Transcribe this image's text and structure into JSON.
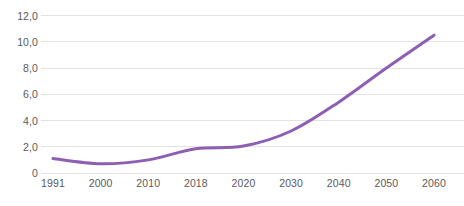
{
  "chart_data": {
    "type": "line",
    "title": "",
    "subtitle": "",
    "xlabel": "",
    "ylabel": "",
    "categories": [
      "1991",
      "2000",
      "2010",
      "2018",
      "2020",
      "2030",
      "2040",
      "2050",
      "2060"
    ],
    "values": [
      1.1,
      0.7,
      1.0,
      1.85,
      2.05,
      3.2,
      5.4,
      8.0,
      10.5
    ],
    "series": [
      {
        "name": "",
        "color": "#8c5eb4",
        "values": [
          1.1,
          0.7,
          1.0,
          1.85,
          2.05,
          3.2,
          5.4,
          8.0,
          10.5
        ]
      }
    ],
    "ylim": [
      0,
      12
    ],
    "ytick_values": [
      12,
      10,
      8,
      6,
      4,
      2,
      0
    ],
    "ytick_labels": [
      "12,0",
      "10,0",
      "8,0",
      "6,0",
      "4,0",
      "2,0",
      "0"
    ],
    "xtick_labels": [
      "1991",
      "2000",
      "2010",
      "2018",
      "2020",
      "2030",
      "2040",
      "2050",
      "2060"
    ],
    "grid": "horizontal",
    "legend": "none",
    "markers": "none",
    "line_width": 3,
    "annotations": []
  },
  "style": {
    "line_color": "#8c5eb4",
    "grid_color": "#e3e3e4",
    "tick_label_color": "#59595b",
    "background_color": "#ffffff"
  }
}
